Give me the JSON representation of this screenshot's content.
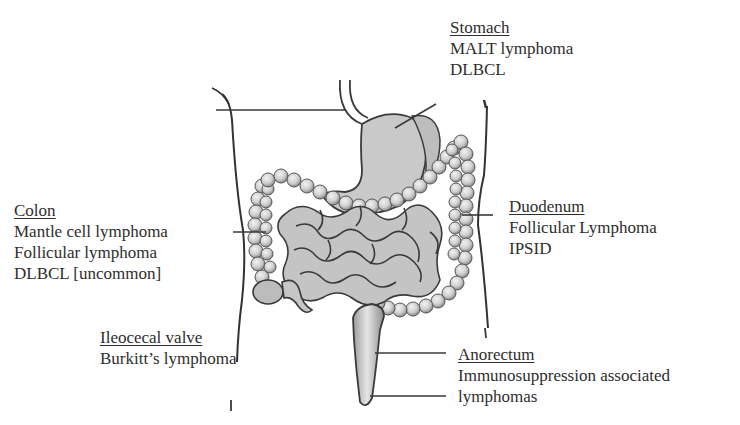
{
  "figure": {
    "colors": {
      "organ_fill": "#c8c8c8",
      "organ_stroke": "#3a3a3a",
      "body_outline": "#333333",
      "leader_line": "#3a3a3a",
      "text": "#2e2e2e"
    }
  },
  "labels": {
    "stomach": {
      "heading": "Stomach",
      "items": [
        "MALT lymphoma",
        "DLBCL"
      ]
    },
    "colon": {
      "heading": "Colon",
      "items": [
        "Mantle cell lymphoma",
        "Follicular lymphoma",
        "DLBCL [uncommon]"
      ]
    },
    "duodenum": {
      "heading": "Duodenum",
      "items": [
        "Follicular Lymphoma",
        "IPSID"
      ]
    },
    "ileocecal": {
      "heading": "Ileocecal valve",
      "items": [
        "Burkitt’s lymphoma"
      ]
    },
    "anorectum": {
      "heading": "Anorectum",
      "items": [
        "Immunosuppression associated",
        "lymphomas"
      ]
    }
  }
}
